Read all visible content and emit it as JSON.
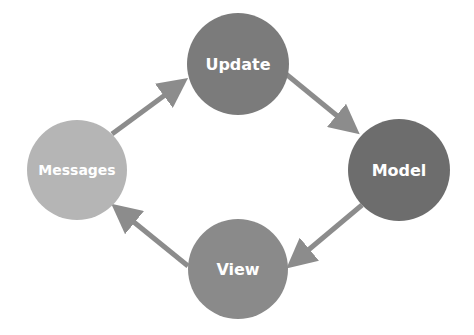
{
  "diagram": {
    "nodes": [
      {
        "id": "update",
        "label": "Update",
        "color": "#7b7b7b",
        "cx": 238,
        "cy": 64,
        "r": 51
      },
      {
        "id": "model",
        "label": "Model",
        "color": "#6d6d6d",
        "cx": 399,
        "cy": 170,
        "r": 51
      },
      {
        "id": "view",
        "label": "View",
        "color": "#8a8a8a",
        "cx": 238,
        "cy": 269,
        "r": 50
      },
      {
        "id": "messages",
        "label": "Messages",
        "color": "#b5b5b5",
        "cx": 77,
        "cy": 170,
        "r": 50
      }
    ],
    "edges": [
      {
        "from": "messages",
        "to": "update"
      },
      {
        "from": "update",
        "to": "model"
      },
      {
        "from": "model",
        "to": "view"
      },
      {
        "from": "view",
        "to": "messages"
      }
    ],
    "arrow_color": "#8c8c8c"
  }
}
